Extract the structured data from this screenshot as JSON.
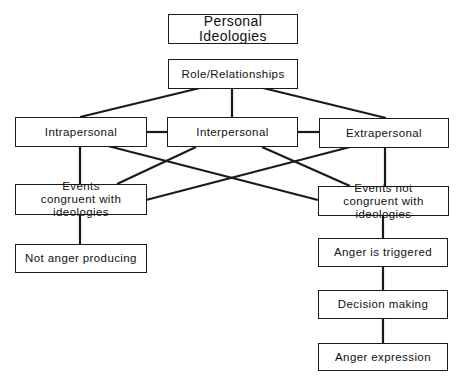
{
  "diagram": {
    "nodes": {
      "personal_ideologies": "Personal Ideologies",
      "role_relationships": "Role/Relationships",
      "intrapersonal": "Intrapersonal",
      "interpersonal": "Interpersonal",
      "extrapersonal": "Extrapersonal",
      "events_congruent": "Events congruent with ideologies",
      "events_not_congruent": "Events not congruent with ideologies",
      "not_anger_producing": "Not anger producing",
      "anger_triggered": "Anger is triggered",
      "decision_making": "Decision making",
      "anger_expression": "Anger expression"
    },
    "edges": [
      [
        "role_relationships",
        "intrapersonal"
      ],
      [
        "role_relationships",
        "interpersonal"
      ],
      [
        "role_relationships",
        "extrapersonal"
      ],
      [
        "intrapersonal",
        "interpersonal"
      ],
      [
        "interpersonal",
        "extrapersonal"
      ],
      [
        "intrapersonal",
        "events_congruent"
      ],
      [
        "intrapersonal",
        "events_not_congruent"
      ],
      [
        "interpersonal",
        "events_congruent"
      ],
      [
        "interpersonal",
        "events_not_congruent"
      ],
      [
        "extrapersonal",
        "events_congruent"
      ],
      [
        "extrapersonal",
        "events_not_congruent"
      ],
      [
        "events_congruent",
        "not_anger_producing"
      ],
      [
        "events_not_congruent",
        "anger_triggered"
      ],
      [
        "anger_triggered",
        "decision_making"
      ],
      [
        "decision_making",
        "anger_expression"
      ]
    ]
  }
}
